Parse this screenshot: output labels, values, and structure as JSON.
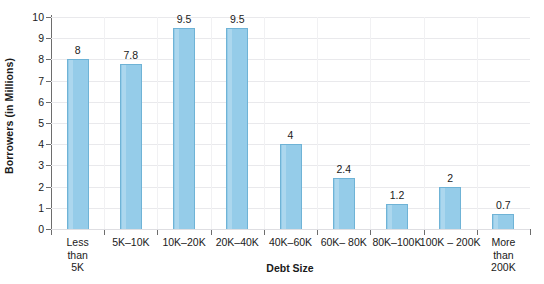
{
  "chart_data": {
    "type": "bar",
    "title": "",
    "xlabel": "Debt Size",
    "ylabel": "Borrowers (in Millions)",
    "categories": [
      "Less\nthan\n5K",
      "5K–10K",
      "10K–20K",
      "20K–40K",
      "40K–60K",
      "60K– 80K",
      "80K–100K",
      "100K – 200K",
      "More\nthan\n200K"
    ],
    "values": [
      8,
      7.8,
      9.5,
      9.5,
      4,
      2.4,
      1.2,
      2,
      0.7
    ],
    "value_labels": [
      "8",
      "7.8",
      "9.5",
      "9.5",
      "4",
      "2.4",
      "1.2",
      "2",
      "0.7"
    ],
    "ylim": [
      0,
      10
    ],
    "ytick_labels": [
      "0",
      "1",
      "2",
      "3",
      "4",
      "5",
      "6",
      "7",
      "8",
      "9",
      "10"
    ],
    "ytick_values": [
      0,
      1,
      2,
      3,
      4,
      5,
      6,
      7,
      8,
      9,
      10
    ],
    "grid": "horizontal",
    "legend": "none",
    "bar_color": "#95CCE9",
    "bar_edge_color": "#6FB3D6",
    "axis_color": "#6D6D6D",
    "grid_color": "#E9E9EC",
    "text_color": "#1A1A1A",
    "background_color": "#FFFFFF"
  }
}
